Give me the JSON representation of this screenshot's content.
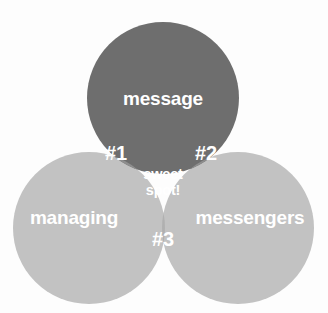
{
  "diagram": {
    "type": "venn",
    "set_count": 3,
    "background_color": "#fdfdfd",
    "canvas": {
      "width": 328,
      "height": 313
    }
  },
  "colors": {
    "dark_fill": "#6e6e6e",
    "light_fill": "#c2c2c2",
    "dark_light_overlap": "#8e8e8e",
    "light_light_overlap": "#b0b0b0",
    "triple_overlap": "#9a9a9a",
    "label_text": "#ffffff"
  },
  "circles": [
    {
      "id": "message",
      "label": "message",
      "cx": 163,
      "cy": 98,
      "r": 76,
      "fill": "#6e6e6e",
      "label_x": 163,
      "label_y": 100
    },
    {
      "id": "managing",
      "label": "managing",
      "cx": 89,
      "cy": 228,
      "r": 76,
      "fill": "#c2c2c2",
      "label_x": 74,
      "label_y": 219
    },
    {
      "id": "messengers",
      "label": "messengers",
      "cx": 238,
      "cy": 228,
      "r": 76,
      "fill": "#c2c2c2",
      "label_x": 250,
      "label_y": 219
    }
  ],
  "regions": [
    {
      "id": "region-1",
      "label": "#1",
      "sets": "message + managing",
      "label_x": 116,
      "label_y": 155,
      "fill": "#8e8e8e"
    },
    {
      "id": "region-2",
      "label": "#2",
      "sets": "message + messengers",
      "label_x": 206,
      "label_y": 155,
      "fill": "#8e8e8e"
    },
    {
      "id": "region-3",
      "label": "#3",
      "sets": "managing + messengers",
      "label_x": 163,
      "label_y": 241,
      "fill": "#b0b0b0"
    },
    {
      "id": "region-center",
      "label_line1": "sweet",
      "label_line2": "spot!",
      "sets": "message + managing + messengers",
      "label_x": 163,
      "label_y_line1": 175,
      "label_y_line2": 191,
      "fill": "#9a9a9a"
    }
  ]
}
